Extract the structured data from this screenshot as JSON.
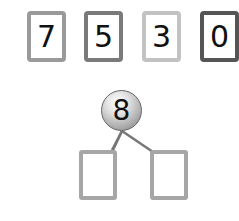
{
  "cards": [
    {
      "value": "7",
      "border_color": "#9a9a9a"
    },
    {
      "value": "5",
      "border_color": "#7a7a7a"
    },
    {
      "value": "3",
      "border_color": "#c2c2c2"
    },
    {
      "value": "0",
      "border_color": "#555555"
    }
  ],
  "number_bond": {
    "whole": "8",
    "parts": [
      "",
      ""
    ]
  }
}
